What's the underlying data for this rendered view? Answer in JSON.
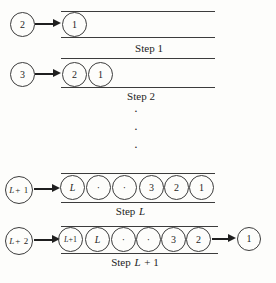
{
  "diagram": {
    "rows": [
      {
        "feeder": {
          "it": "",
          "rm": "2"
        },
        "queue": [
          {
            "it": "",
            "rm": "1"
          }
        ],
        "label": {
          "pre": "Step 1",
          "it": "",
          "post": ""
        }
      },
      {
        "feeder": {
          "it": "",
          "rm": "3"
        },
        "queue": [
          {
            "it": "",
            "rm": "2"
          },
          {
            "it": "",
            "rm": "1"
          }
        ],
        "label": {
          "pre": "Step 2",
          "it": "",
          "post": ""
        }
      },
      {
        "feeder": {
          "it": "L",
          "rm": "+ 1"
        },
        "queue": [
          {
            "it": "L",
            "rm": ""
          },
          {
            "it": "",
            "rm": "·"
          },
          {
            "it": "",
            "rm": "·"
          },
          {
            "it": "",
            "rm": "3"
          },
          {
            "it": "",
            "rm": "2"
          },
          {
            "it": "",
            "rm": "1"
          }
        ],
        "label": {
          "pre": "Step",
          "it": "L",
          "post": ""
        }
      },
      {
        "feeder": {
          "it": "L",
          "rm": "+ 2"
        },
        "queue": [
          {
            "it": "L",
            "rm": "+1"
          },
          {
            "it": "L",
            "rm": ""
          },
          {
            "it": "",
            "rm": "·"
          },
          {
            "it": "",
            "rm": "·"
          },
          {
            "it": "",
            "rm": "3"
          },
          {
            "it": "",
            "rm": "2"
          }
        ],
        "output": {
          "it": "",
          "rm": "1"
        },
        "label": {
          "pre": "Step",
          "it": "L",
          "post": "+ 1"
        }
      }
    ],
    "ellipsis": [
      "·",
      "·",
      "·"
    ]
  }
}
